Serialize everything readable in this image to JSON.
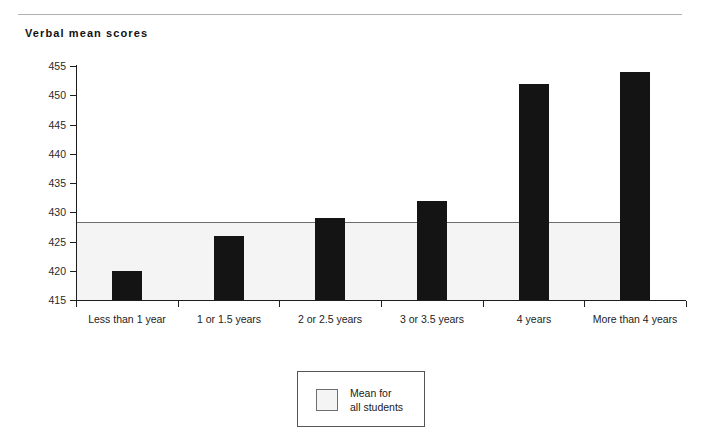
{
  "chart_data": {
    "type": "bar",
    "title": "Verbal mean scores",
    "xlabel": "",
    "ylabel": "",
    "ylim": [
      415,
      455
    ],
    "yticks": [
      415,
      420,
      425,
      430,
      435,
      440,
      445,
      450,
      455
    ],
    "grid": false,
    "categories": [
      "Less than 1 year",
      "1 or 1.5 years",
      "2 or 2.5 years",
      "3 or 3.5 years",
      "4 years",
      "More than 4 years"
    ],
    "values": [
      420,
      426,
      429,
      432,
      452,
      454
    ],
    "series": [
      {
        "name": "Verbal mean score",
        "values": [
          420,
          426,
          429,
          432,
          452,
          454
        ],
        "color": "#141414"
      }
    ],
    "reference_band": {
      "label": "Mean for all students",
      "value": 428,
      "from": 415,
      "to": 428,
      "color": "#f4f4f4"
    },
    "legend": {
      "position": "bottom-center",
      "entries": [
        {
          "label_line1": "Mean for",
          "label_line2": "all students",
          "swatch_color": "#f4f4f4"
        }
      ]
    }
  },
  "figure": {
    "title": "Verbal mean scores",
    "axis": {
      "y_tick_labels": [
        "455",
        "450",
        "445",
        "440",
        "435",
        "430",
        "425",
        "420",
        "415"
      ]
    },
    "legend": {
      "line1": "Mean for",
      "line2": "all students"
    }
  }
}
